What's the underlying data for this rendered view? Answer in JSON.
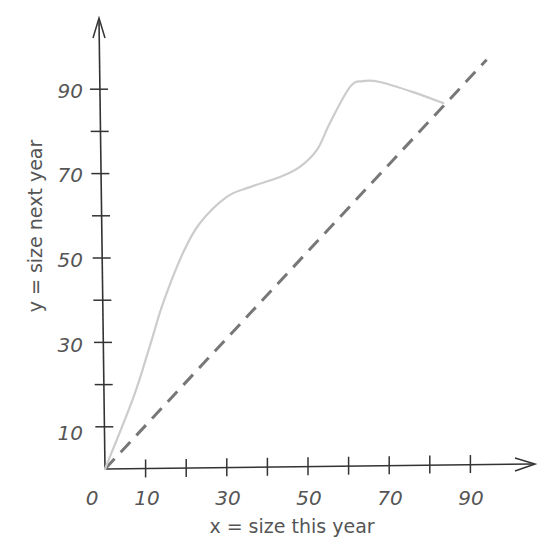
{
  "chart_data": {
    "type": "line",
    "title": "",
    "xlabel": "x = size this year",
    "ylabel": "y = size next year",
    "xlim": [
      0,
      100
    ],
    "ylim": [
      0,
      100
    ],
    "grid": false,
    "legend": null,
    "x_tick_labels": [
      "0",
      "10",
      "30",
      "50",
      "70",
      "90"
    ],
    "x_ticks": [
      10,
      20,
      30,
      40,
      50,
      60,
      70,
      80,
      90
    ],
    "y_tick_labels": [
      "10",
      "30",
      "50",
      "70",
      "90"
    ],
    "y_ticks": [
      10,
      20,
      30,
      40,
      50,
      60,
      70,
      80,
      90
    ],
    "series": [
      {
        "name": "growth curve",
        "style": "solid",
        "color": "#cccccc",
        "x": [
          0,
          7,
          11,
          14.3,
          19.2,
          23.4,
          30,
          35.7,
          43.1,
          48,
          52.2,
          55.4,
          60.3,
          63.5,
          67.7,
          75.9,
          83.3
        ],
        "y": [
          0,
          17,
          29,
          39.3,
          51.2,
          58.3,
          64.5,
          66.8,
          69.2,
          71.6,
          75.6,
          82,
          90.5,
          91.9,
          91.7,
          89.3,
          86.7
        ]
      },
      {
        "name": "y = x",
        "style": "dashed",
        "color": "#777777",
        "x": [
          0,
          94
        ],
        "y": [
          0,
          97
        ]
      }
    ]
  },
  "labels": {
    "origin": "0",
    "xlabel": "x = size this year",
    "ylabel": "y = size next year",
    "x": [
      "10",
      "30",
      "50",
      "70",
      "90"
    ],
    "y": [
      "10",
      "30",
      "50",
      "70",
      "90"
    ]
  },
  "colors": {
    "axis": "#333333",
    "curve": "#cccccc",
    "dashed": "#777777",
    "text": "#555555"
  }
}
